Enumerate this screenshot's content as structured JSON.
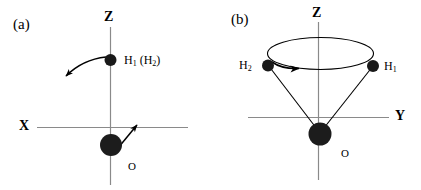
{
  "figure": {
    "background_color": "#ffffff",
    "stroke_color": "#000000",
    "axis_color": "#808080",
    "atom_color": "#1a1a1a",
    "width": 421,
    "height": 190
  },
  "panels": [
    {
      "tag": "(a)",
      "description": "In-plane libration of water in the XZ plane",
      "axes": [
        {
          "name": "Z",
          "label": "Z",
          "orientation": "vertical"
        },
        {
          "name": "X",
          "label": "X",
          "orientation": "horizontal"
        }
      ],
      "atoms": [
        {
          "name": "hydrogen",
          "label": "H",
          "subscript": "1",
          "paren_label": "(H",
          "paren_subscript": "2",
          "paren_close": ")",
          "full_label": "H1 (H2)"
        },
        {
          "name": "oxygen",
          "label": "O",
          "full_label": "O"
        }
      ],
      "arrows": [
        {
          "name": "hydrogen-motion-arrow",
          "style": "curved",
          "direction": "down-left"
        },
        {
          "name": "oxygen-motion-arrow",
          "style": "straight",
          "direction": "up-right"
        }
      ]
    },
    {
      "tag": "(b)",
      "description": "Rotation of the two hydrogens on a cone about the Z axis",
      "axes": [
        {
          "name": "Z",
          "label": "Z",
          "orientation": "vertical"
        },
        {
          "name": "Y",
          "label": "Y",
          "orientation": "horizontal"
        }
      ],
      "atoms": [
        {
          "name": "hydrogen-2",
          "label": "H",
          "subscript": "2",
          "full_label": "H2"
        },
        {
          "name": "hydrogen-1",
          "label": "H",
          "subscript": "1",
          "full_label": "H1"
        },
        {
          "name": "oxygen",
          "label": "O",
          "full_label": "O"
        }
      ],
      "arrows": [
        {
          "name": "rotation-arrow",
          "style": "ellipse-arrowhead",
          "direction": "clockwise-from-above"
        }
      ]
    }
  ]
}
